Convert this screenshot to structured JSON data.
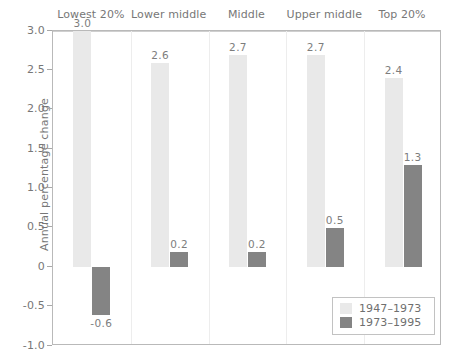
{
  "chart_data": {
    "type": "bar",
    "title": "",
    "subtitle": "",
    "xlabel": "",
    "ylabel": "Annual percentage change",
    "ylim": [
      -1.0,
      3.0
    ],
    "yticks": [
      "3.0",
      "2.5",
      "2.0",
      "1.5",
      "1.0",
      "0.5",
      "0",
      "-0.5",
      "-1.0"
    ],
    "ytick_values": [
      3.0,
      2.5,
      2.0,
      1.5,
      1.0,
      0.5,
      0,
      -0.5,
      -1.0
    ],
    "grid": false,
    "legend_position": "bottom-right",
    "categories": [
      "Lowest 20%",
      "Lower middle",
      "Middle",
      "Upper middle",
      "Top 20%"
    ],
    "series": [
      {
        "name": "1947–1973",
        "color": "#e9e9e9",
        "values": [
          3.0,
          2.6,
          2.7,
          2.7,
          2.4
        ],
        "labels": [
          "3.0",
          "2.6",
          "2.7",
          "2.7",
          "2.4"
        ]
      },
      {
        "name": "1973–1995",
        "color": "#848484",
        "values": [
          -0.6,
          0.2,
          0.2,
          0.5,
          1.3
        ],
        "labels": [
          "-0.6",
          "0.2",
          "0.2",
          "0.5",
          "1.3"
        ]
      }
    ]
  },
  "legend": {
    "items": [
      {
        "label": "1947–1973",
        "color": "#e9e9e9"
      },
      {
        "label": "1973–1995",
        "color": "#848484"
      }
    ]
  },
  "axis": {
    "y_title": "Annual percentage change"
  }
}
